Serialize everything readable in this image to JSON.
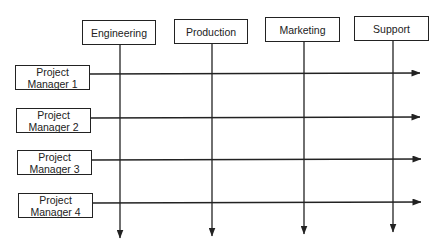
{
  "diagram": {
    "type": "matrix-organization",
    "stroke_color": "#222222",
    "background_color": "#ffffff",
    "departments": [
      {
        "label": "Engineering",
        "box": {
          "x": 82,
          "y": 20,
          "w": 74
        },
        "line_x": 120,
        "arrow_tip_y": 238
      },
      {
        "label": "Production",
        "box": {
          "x": 174,
          "y": 19,
          "w": 74
        },
        "line_x": 212,
        "arrow_tip_y": 236
      },
      {
        "label": "Marketing",
        "box": {
          "x": 265,
          "y": 17,
          "w": 75
        },
        "line_x": 304,
        "arrow_tip_y": 234
      },
      {
        "label": "Support",
        "box": {
          "x": 354,
          "y": 16,
          "w": 75
        },
        "line_x": 393,
        "arrow_tip_y": 232
      }
    ],
    "project_managers": [
      {
        "line1": "Project",
        "line2": "Manager 1",
        "box": {
          "x": 15,
          "y": 65
        },
        "line_y": 74,
        "arrow_tip_x": 420
      },
      {
        "line1": "Project",
        "line2": "Manager 2",
        "box": {
          "x": 16,
          "y": 108
        },
        "line_y": 118,
        "arrow_tip_x": 420
      },
      {
        "line1": "Project",
        "line2": "Manager 3",
        "box": {
          "x": 17,
          "y": 150
        },
        "line_y": 160,
        "arrow_tip_x": 421
      },
      {
        "line1": "Project",
        "line2": "Manager 4",
        "box": {
          "x": 18,
          "y": 193
        },
        "line_y": 203,
        "arrow_tip_x": 421
      }
    ]
  }
}
